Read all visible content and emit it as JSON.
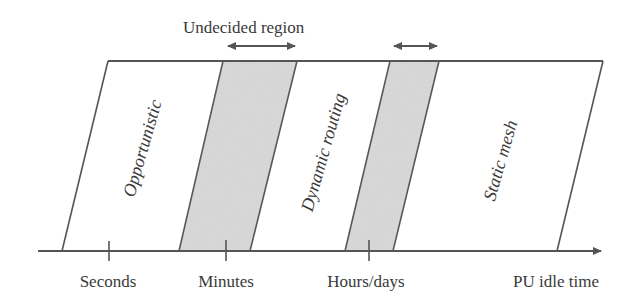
{
  "title_annotation": "Undecided region",
  "regions": [
    {
      "label": "Opportunistic",
      "kind": "white"
    },
    {
      "label": "Undecided band 1",
      "kind": "gray"
    },
    {
      "label": "Dynamic routing",
      "kind": "white"
    },
    {
      "label": "Undecided band 2",
      "kind": "gray"
    },
    {
      "label": "Static mesh",
      "kind": "white"
    }
  ],
  "axis": {
    "label": "PU idle time",
    "ticks": [
      "Seconds",
      "Minutes",
      "Hours/days"
    ]
  },
  "colors": {
    "line": "#555555",
    "gray_fill": "#d8d8d8",
    "text": "#3a3a3a",
    "background": "#ffffff"
  }
}
